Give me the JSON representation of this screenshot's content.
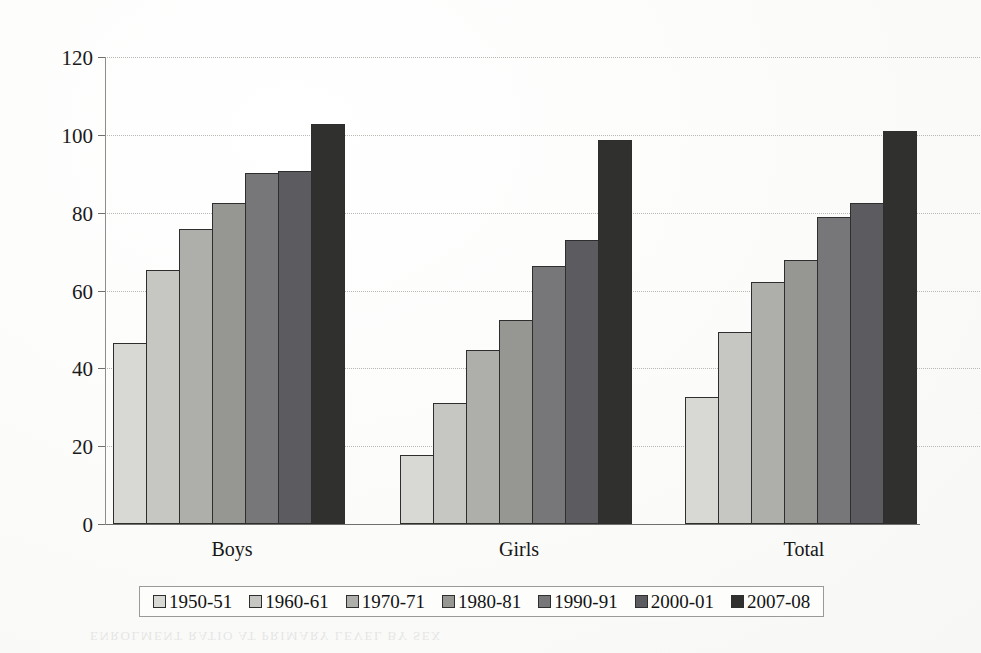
{
  "chart_data": {
    "type": "bar",
    "title": "",
    "subtitle": "",
    "xlabel": "",
    "ylabel": "",
    "categories": [
      "Boys",
      "Girls",
      "Total"
    ],
    "ylim": [
      0,
      120
    ],
    "yticks": [
      0,
      20,
      40,
      60,
      80,
      100,
      120
    ],
    "ytick_labels": [
      "0",
      "20",
      "40",
      "60",
      "80",
      "100",
      "120"
    ],
    "grid": true,
    "legend_position": "bottom",
    "series": [
      {
        "name": "1950-51",
        "color": "#d8d8d4",
        "values": [
          46.4,
          17.7,
          32.6
        ]
      },
      {
        "name": "1960-61",
        "color": "#c6c6c2",
        "values": [
          65.2,
          31.1,
          49.3
        ]
      },
      {
        "name": "1970-71",
        "color": "#aeaeaa",
        "values": [
          75.9,
          44.7,
          62.3
        ]
      },
      {
        "name": "1980-81",
        "color": "#969692",
        "values": [
          82.4,
          52.5,
          67.9
        ]
      },
      {
        "name": "1990-91",
        "color": "#77777a",
        "values": [
          90.3,
          66.2,
          79.0
        ]
      },
      {
        "name": "2000-01",
        "color": "#5c5c60",
        "values": [
          90.7,
          73.1,
          82.4
        ]
      },
      {
        "name": "2007-08",
        "color": "#30302f",
        "values": [
          102.7,
          98.7,
          101.1
        ]
      }
    ]
  },
  "axis": {
    "y_ticks": [
      "120",
      "100",
      "80",
      "60",
      "40",
      "20",
      "0"
    ]
  },
  "legend": {
    "items": [
      "1950-51",
      "1960-61",
      "1970-71",
      "1980-81",
      "1990-91",
      "2000-01",
      "2007-08"
    ]
  },
  "categories": {
    "items": [
      "Boys",
      "Girls",
      "Total"
    ]
  },
  "bleed_text": "ENROLMENT RATIO AT PRIMARY LEVEL BY SEX"
}
